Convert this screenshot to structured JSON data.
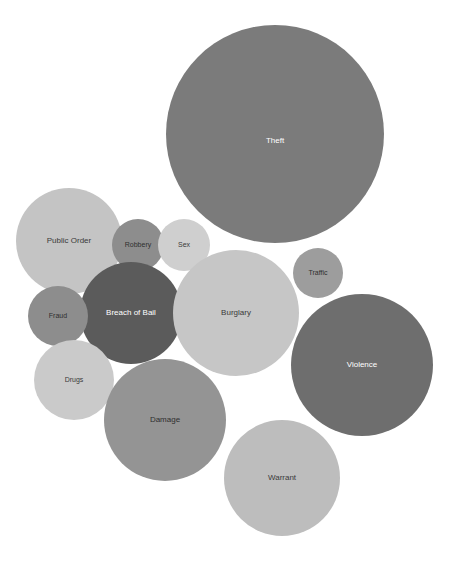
{
  "chart_data": {
    "type": "bubble",
    "title": "",
    "subtitle": "",
    "xlabel": "",
    "ylabel": "",
    "legend": "none",
    "grid": false,
    "axes_visible": false,
    "background_color": "#ffffff",
    "label_color_light": "#ffffff",
    "label_color_dark": "#333333",
    "categories": [
      "Theft",
      "Public Order",
      "Robbery",
      "Sex",
      "Traffic",
      "Breach of Bail",
      "Burglary",
      "Fraud",
      "Violence",
      "Drugs",
      "Damage",
      "Warrant"
    ],
    "values": [
      109,
      53,
      26,
      26,
      25,
      51,
      63,
      30,
      71,
      40,
      61,
      58
    ],
    "points": [
      {
        "label": "Theft",
        "cx": 275,
        "cy": 134,
        "r": 109,
        "color": "#7b7b7b",
        "label_color": "#ffffff",
        "label_size": 8,
        "label_dy": 7
      },
      {
        "label": "Public Order",
        "cx": 69,
        "cy": 241,
        "r": 53,
        "color": "#c4c4c4",
        "label_color": "#3a3a3a",
        "label_size": 8,
        "label_dy": 0
      },
      {
        "label": "Robbery",
        "cx": 138,
        "cy": 245,
        "r": 26,
        "color": "#8d8d8d",
        "label_color": "#2f2f2f",
        "label_size": 7,
        "label_dy": 0
      },
      {
        "label": "Sex",
        "cx": 184,
        "cy": 245,
        "r": 26,
        "color": "#cfcfcf",
        "label_color": "#3a3a3a",
        "label_size": 7,
        "label_dy": 0
      },
      {
        "label": "Traffic",
        "cx": 318,
        "cy": 273,
        "r": 25,
        "color": "#9d9d9d",
        "label_color": "#2f2f2f",
        "label_size": 7,
        "label_dy": 0
      },
      {
        "label": "Breach of Bail",
        "cx": 131,
        "cy": 313,
        "r": 51,
        "color": "#5b5b5b",
        "label_color": "#ffffff",
        "label_size": 8,
        "label_dy": 0
      },
      {
        "label": "Burglary",
        "cx": 236,
        "cy": 313,
        "r": 63,
        "color": "#c6c6c6",
        "label_color": "#3a3a3a",
        "label_size": 8,
        "label_dy": 0
      },
      {
        "label": "Fraud",
        "cx": 58,
        "cy": 316,
        "r": 30,
        "color": "#8d8d8d",
        "label_color": "#2f2f2f",
        "label_size": 7,
        "label_dy": 0
      },
      {
        "label": "Violence",
        "cx": 362,
        "cy": 365,
        "r": 71,
        "color": "#6e6e6e",
        "label_color": "#ffffff",
        "label_size": 8,
        "label_dy": 0
      },
      {
        "label": "Drugs",
        "cx": 74,
        "cy": 380,
        "r": 40,
        "color": "#cacaca",
        "label_color": "#3a3a3a",
        "label_size": 7,
        "label_dy": 0
      },
      {
        "label": "Damage",
        "cx": 165,
        "cy": 420,
        "r": 61,
        "color": "#949494",
        "label_color": "#2f2f2f",
        "label_size": 8,
        "label_dy": 0
      },
      {
        "label": "Warrant",
        "cx": 282,
        "cy": 478,
        "r": 58,
        "color": "#bdbdbd",
        "label_color": "#3a3a3a",
        "label_size": 8,
        "label_dy": 0
      }
    ]
  },
  "caption": {
    "text": ""
  }
}
